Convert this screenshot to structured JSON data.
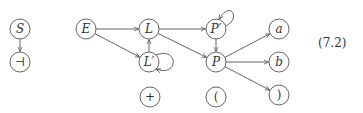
{
  "diagram": {
    "nodes": [
      {
        "id": "S",
        "label": "S",
        "x": 20,
        "y": 29,
        "italic": true
      },
      {
        "id": "end",
        "label": "⊣",
        "x": 20,
        "y": 62,
        "italic": false
      },
      {
        "id": "E",
        "label": "E",
        "x": 86,
        "y": 29,
        "italic": true
      },
      {
        "id": "L",
        "label": "L",
        "x": 149,
        "y": 29,
        "italic": true
      },
      {
        "id": "Lp",
        "label": "L′",
        "x": 149,
        "y": 62,
        "italic": true
      },
      {
        "id": "plus",
        "label": "+",
        "x": 150,
        "y": 97,
        "italic": false
      },
      {
        "id": "Pp",
        "label": "P′",
        "x": 216,
        "y": 29,
        "italic": true
      },
      {
        "id": "P",
        "label": "P",
        "x": 216,
        "y": 62,
        "italic": true
      },
      {
        "id": "lparen",
        "label": "(",
        "x": 216,
        "y": 97,
        "italic": false
      },
      {
        "id": "a",
        "label": "a",
        "x": 279,
        "y": 29,
        "italic": true
      },
      {
        "id": "b",
        "label": "b",
        "x": 279,
        "y": 62,
        "italic": true
      },
      {
        "id": "rparen",
        "label": ")",
        "x": 279,
        "y": 95,
        "italic": false
      }
    ],
    "edges": [
      {
        "from": "S",
        "to": "end"
      },
      {
        "from": "E",
        "to": "L"
      },
      {
        "from": "E",
        "to": "Lp"
      },
      {
        "from": "Lp",
        "to": "L"
      },
      {
        "from": "Lp",
        "to": "Lp",
        "loop": "right"
      },
      {
        "from": "L",
        "to": "Pp"
      },
      {
        "from": "L",
        "to": "P"
      },
      {
        "from": "Pp",
        "to": "Pp",
        "loop": "top-right"
      },
      {
        "from": "Pp",
        "to": "P"
      },
      {
        "from": "P",
        "to": "a"
      },
      {
        "from": "P",
        "to": "b"
      },
      {
        "from": "P",
        "to": "rparen"
      }
    ],
    "equation_number": "(7.2)"
  }
}
